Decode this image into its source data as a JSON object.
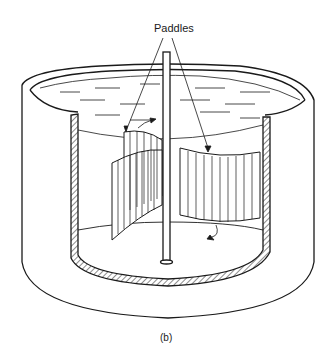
{
  "figure": {
    "callout_label": "Paddles",
    "caption": "(b)",
    "components": [
      "cylindrical-tank",
      "tank-wall-cross-section",
      "liquid-surface",
      "vertical-shaft",
      "paddles",
      "flow-direction-arrows"
    ],
    "colors": {
      "line": "#1a1a1a",
      "background": "#ffffff"
    }
  }
}
